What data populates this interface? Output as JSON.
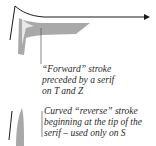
{
  "diagram": {
    "callouts": [
      {
        "id": "forward-stroke",
        "lines": [
          "“Forward” stroke",
          "preceded by a serif",
          "on T and Z"
        ]
      },
      {
        "id": "reverse-stroke",
        "lines": [
          "Curved “reverse” stroke",
          "beginning at the tip of the",
          "serif – used only on S"
        ]
      }
    ],
    "colors": {
      "stroke_fill": "#a9a9a9",
      "outline": "#1a1a1a",
      "leader_line": "#555555"
    }
  }
}
